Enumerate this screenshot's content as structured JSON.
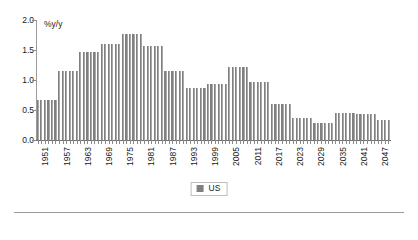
{
  "chart_data": {
    "type": "bar",
    "title": "",
    "subtitle": "",
    "xlabel": "",
    "ylabel": "%y/y",
    "unit_label": "%y/y",
    "ylim": [
      0.0,
      2.0
    ],
    "ytick_values": [
      0.0,
      0.5,
      1.0,
      1.5,
      2.0
    ],
    "ytick_labels": [
      "0.0",
      "0.5",
      "1.0",
      "1.5",
      "2.0"
    ],
    "grid": false,
    "legend": {
      "position": "bottom-center",
      "entries": [
        {
          "name": "US",
          "color": "#808080"
        }
      ]
    },
    "xtick_labels": [
      "1951",
      "1957",
      "1963",
      "1969",
      "1975",
      "1981",
      "1987",
      "1993",
      "1999",
      "2005",
      "2011",
      "2017",
      "2023",
      "2029",
      "2035",
      "2041",
      "2047"
    ],
    "xtick_step_years": 6,
    "series_name": "US",
    "bar_color": "#808080",
    "categories": [
      "1951",
      "1952",
      "1953",
      "1954",
      "1955",
      "1956",
      "1957",
      "1958",
      "1959",
      "1960",
      "1961",
      "1962",
      "1963",
      "1964",
      "1965",
      "1966",
      "1967",
      "1968",
      "1969",
      "1970",
      "1971",
      "1972",
      "1973",
      "1974",
      "1975",
      "1976",
      "1977",
      "1978",
      "1979",
      "1980",
      "1981",
      "1982",
      "1983",
      "1984",
      "1985",
      "1986",
      "1987",
      "1988",
      "1989",
      "1990",
      "1991",
      "1992",
      "1993",
      "1994",
      "1995",
      "1996",
      "1997",
      "1998",
      "1999",
      "2000",
      "2001",
      "2002",
      "2003",
      "2004",
      "2005",
      "2006",
      "2007",
      "2008",
      "2009",
      "2010",
      "2011",
      "2012",
      "2013",
      "2014",
      "2015",
      "2016",
      "2017",
      "2018",
      "2019",
      "2020",
      "2021",
      "2022",
      "2023",
      "2024",
      "2025",
      "2026",
      "2027",
      "2028",
      "2029",
      "2030",
      "2031",
      "2032",
      "2033",
      "2034",
      "2035",
      "2036",
      "2037",
      "2038",
      "2039",
      "2040",
      "2041",
      "2042",
      "2043",
      "2044",
      "2045",
      "2046",
      "2047",
      "2048",
      "2049",
      "2050"
    ],
    "values": [
      0.67,
      0.67,
      0.67,
      0.67,
      0.67,
      0.67,
      1.15,
      1.15,
      1.15,
      1.15,
      1.15,
      1.15,
      1.47,
      1.47,
      1.47,
      1.47,
      1.47,
      1.47,
      1.6,
      1.6,
      1.6,
      1.6,
      1.6,
      1.6,
      1.77,
      1.77,
      1.77,
      1.77,
      1.77,
      1.77,
      1.56,
      1.56,
      1.56,
      1.56,
      1.56,
      1.56,
      1.15,
      1.15,
      1.15,
      1.15,
      1.15,
      1.15,
      0.87,
      0.87,
      0.87,
      0.87,
      0.87,
      0.87,
      0.93,
      0.93,
      0.93,
      0.93,
      0.93,
      0.93,
      1.22,
      1.22,
      1.22,
      1.22,
      1.22,
      1.22,
      0.97,
      0.97,
      0.97,
      0.97,
      0.97,
      0.97,
      0.6,
      0.6,
      0.6,
      0.6,
      0.6,
      0.6,
      0.37,
      0.37,
      0.37,
      0.37,
      0.37,
      0.37,
      0.28,
      0.28,
      0.28,
      0.28,
      0.28,
      0.28,
      0.45,
      0.45,
      0.45,
      0.45,
      0.45,
      0.45,
      0.44,
      0.44,
      0.44,
      0.44,
      0.44,
      0.44,
      0.33,
      0.33,
      0.33,
      0.33
    ]
  }
}
